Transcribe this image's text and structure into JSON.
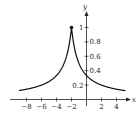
{
  "chart_data": {
    "type": "line",
    "title": "",
    "xlabel": "x",
    "ylabel": "y",
    "function": "y = 1/(1+|x+2|)",
    "xlim": [
      -9.1,
      5.2
    ],
    "ylim": [
      0,
      1.1
    ],
    "x_ticks": [
      -8,
      -6,
      -4,
      -2,
      2,
      4
    ],
    "x_tick_labels": [
      "-8",
      "-6",
      "-4",
      "-2",
      "2",
      "4"
    ],
    "y_ticks": [
      0.2,
      0.4,
      0.6,
      0.8,
      1
    ],
    "y_tick_labels": [
      "0.2",
      "0.4",
      "0.6",
      "0.8",
      "1"
    ],
    "grid": false,
    "legend": null,
    "series": [
      {
        "name": "f(x)",
        "x": [
          -9,
          -8,
          -7,
          -6,
          -5,
          -4,
          -3,
          -2.5,
          -2,
          -1.5,
          -1,
          0,
          1,
          2,
          3,
          4,
          5
        ],
        "values": [
          0.125,
          0.143,
          0.167,
          0.2,
          0.25,
          0.333,
          0.5,
          0.667,
          1,
          0.667,
          0.5,
          0.333,
          0.25,
          0.2,
          0.167,
          0.143,
          0.125
        ]
      }
    ],
    "annotations": [
      {
        "type": "point",
        "x": -2,
        "y": 1,
        "style": "filled"
      }
    ],
    "colors": {
      "curve": "#111111",
      "axes": "#222222"
    }
  }
}
